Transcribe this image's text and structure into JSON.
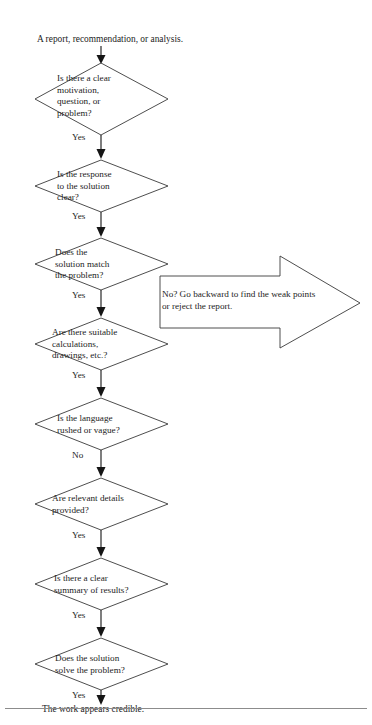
{
  "diagram": {
    "title_text": "A report, recommendation, or analysis.",
    "end_text": "The work appears credible.",
    "callout": {
      "text": "No? Go backward to find the weak points\nor reject the report.",
      "line1": "No? Go backward to find the weak points",
      "line2": "or reject the report."
    },
    "colors": {
      "shape_stroke": "#3a3a3a",
      "connector": "#151515",
      "text": "#1d1d1d",
      "rule": "#8c8c8c",
      "background": "#ffffff"
    },
    "nodes": [
      {
        "id": "start",
        "type": "text",
        "label": "A report, recommendation, or analysis."
      },
      {
        "id": "d1",
        "type": "decision",
        "label": "Is there a clear\nmotivation,\nquestion, or\nproblem?",
        "edge_label": "Yes"
      },
      {
        "id": "d2",
        "type": "decision",
        "label": "Is the response\nto the solution\nclear?",
        "edge_label": "Yes"
      },
      {
        "id": "d3",
        "type": "decision",
        "label": "Does the\nsolution match\nthe problem?",
        "edge_label": "Yes"
      },
      {
        "id": "d4",
        "type": "decision",
        "label": "Are there suitable\ncalculations,\ndrawings, etc.?",
        "edge_label": "Yes"
      },
      {
        "id": "d5",
        "type": "decision",
        "label": "Is the language\nrushed or vague?",
        "edge_label": "No"
      },
      {
        "id": "d6",
        "type": "decision",
        "label": "Are relevant details\nprovided?",
        "edge_label": "Yes"
      },
      {
        "id": "d7",
        "type": "decision",
        "label": "Is there a clear\nsummary of results?",
        "edge_label": "Yes"
      },
      {
        "id": "d8",
        "type": "decision",
        "label": "Does the solution\nsolve the problem?",
        "edge_label": "Yes"
      },
      {
        "id": "end",
        "type": "text",
        "label": "The work appears credible."
      }
    ]
  }
}
